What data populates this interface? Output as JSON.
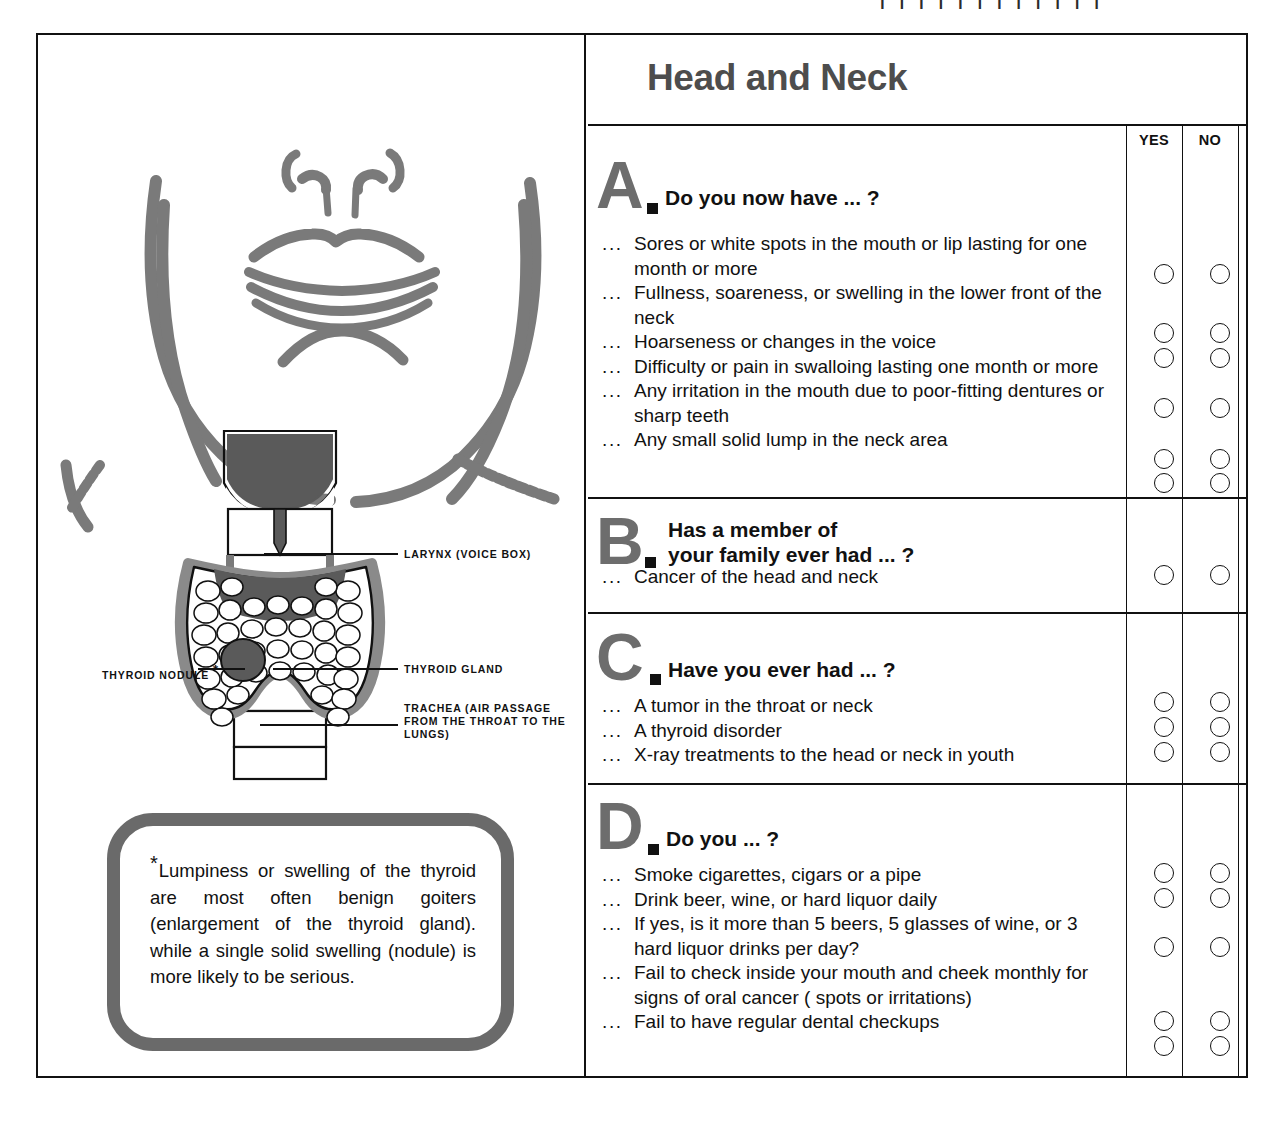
{
  "scan_artifacts": {
    "visible": true,
    "fragment": "| | | | | | | | |  |  | |"
  },
  "form": {
    "title": "Head and Neck",
    "answer_columns": [
      "YES",
      "NO"
    ]
  },
  "illustration": {
    "title": "head-and-neck-anatomy",
    "labels": {
      "larynx": "LARYNX (VOICE BOX)",
      "thyroid_gland": "THYROID GLAND",
      "thyroid_nodule": "THYROID NODULE",
      "thyroid_nodule_marker": "*",
      "trachea": "TRACHEA (AIR PASSAGE FROM THE THROAT TO THE LUNGS)"
    },
    "note": {
      "marker": "*",
      "text": "Lumpiness or swelling of the thyroid are most often benign goiters (enlargement of the thyroid gland). while a single solid swelling (nodule) is more likely to be serious."
    }
  },
  "sections": [
    {
      "letter": "A",
      "prompt": "Do you now have ... ?",
      "lead": "...",
      "items": [
        {
          "text": "Sores or white spots in the mouth or lip lasting for one month or more",
          "lines": 2
        },
        {
          "text": "Fullness, soareness, or swelling in the lower front of the neck",
          "lines": 2
        },
        {
          "text": "Hoarseness or changes in the voice",
          "lines": 1
        },
        {
          "text": "Difficulty or pain in swalloing lasting one month or more",
          "lines": 2
        },
        {
          "text": "Any irritation in the mouth due to poor-fitting dentures or sharp teeth",
          "lines": 2
        },
        {
          "text": "Any small solid lump in the neck area",
          "lines": 1
        }
      ]
    },
    {
      "letter": "B",
      "prompt": "Has a member of your family ever had ... ?",
      "lead": "...",
      "items": [
        {
          "text": "Cancer of the head and neck",
          "lines": 1
        }
      ]
    },
    {
      "letter": "C",
      "prompt": "Have you ever had ... ?",
      "lead": "...",
      "items": [
        {
          "text": "A tumor in the throat or neck",
          "lines": 1
        },
        {
          "text": "A thyroid disorder",
          "lines": 1
        },
        {
          "text": "X-ray treatments to the head or neck in youth",
          "lines": 1
        }
      ]
    },
    {
      "letter": "D",
      "prompt": "Do you ... ?",
      "lead": "...",
      "items": [
        {
          "text": "Smoke cigarettes, cigars or a pipe",
          "lines": 1
        },
        {
          "text": "Drink beer, wine, or hard liquor daily",
          "lines": 1
        },
        {
          "text": "If yes, is it more than 5 beers, 5 glasses of wine, or 3 hard liquor drinks per day?",
          "lines": 2
        },
        {
          "text": "Fail to check inside your mouth and cheek monthly for signs of oral cancer ( spots or irritations)",
          "lines": 3
        },
        {
          "text": "Fail to have regular dental checkups",
          "lines": 1
        }
      ]
    }
  ],
  "colors": {
    "ink": "#111111",
    "section_letter_gray": "#6d6d6d",
    "title_gray": "#4d4d4d",
    "note_border_gray": "#6a6a6a",
    "anatomy_gray": "#7a7a7a",
    "anatomy_dark": "#5a5a5a",
    "paper": "#ffffff"
  }
}
